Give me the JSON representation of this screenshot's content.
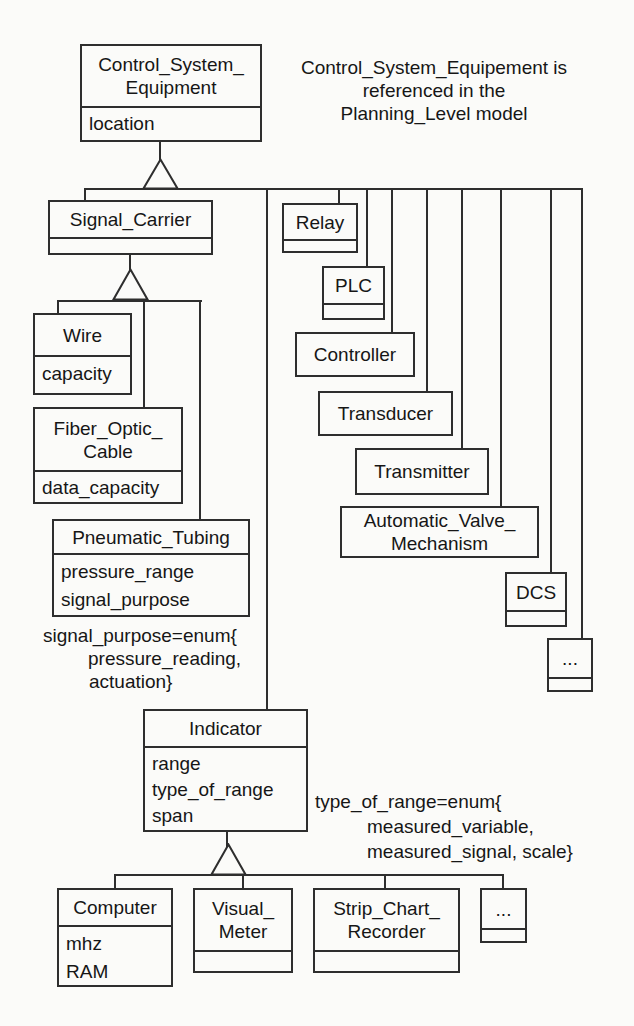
{
  "colors": {
    "background": "#fbfbf9",
    "line": "#2e2e2e",
    "text": "#161616"
  },
  "diagram_type": "class-inheritance-diagram",
  "annotations": {
    "top_note": {
      "lines": [
        "Control_System_Equipement is",
        "referenced in the",
        "Planning_Level model"
      ]
    },
    "signal_purpose_note": {
      "lines": [
        "signal_purpose=enum{",
        "pressure_reading,",
        "actuation}"
      ]
    },
    "type_of_range_note": {
      "lines": [
        "type_of_range=enum{",
        "measured_variable,",
        "measured_signal, scale}"
      ]
    }
  },
  "classes": {
    "cse": {
      "title_lines": [
        "Control_System_",
        "Equipment"
      ],
      "attributes": [
        "location"
      ]
    },
    "signal_carrier": {
      "title_lines": [
        "Signal_Carrier"
      ],
      "attributes": []
    },
    "relay": {
      "title_lines": [
        "Relay"
      ],
      "attributes": []
    },
    "plc": {
      "title_lines": [
        "PLC"
      ],
      "attributes": []
    },
    "controller": {
      "title_lines": [
        "Controller"
      ],
      "attributes": []
    },
    "transducer": {
      "title_lines": [
        "Transducer"
      ],
      "attributes": []
    },
    "transmitter": {
      "title_lines": [
        "Transmitter"
      ],
      "attributes": []
    },
    "avm": {
      "title_lines": [
        "Automatic_Valve_",
        "Mechanism"
      ],
      "attributes": []
    },
    "dcs": {
      "title_lines": [
        "DCS"
      ],
      "attributes": []
    },
    "dots_right": {
      "title_lines": [
        "..."
      ],
      "attributes": []
    },
    "wire": {
      "title_lines": [
        "Wire"
      ],
      "attributes": [
        "capacity"
      ]
    },
    "foc": {
      "title_lines": [
        "Fiber_Optic_",
        "Cable"
      ],
      "attributes": [
        "data_capacity"
      ]
    },
    "pneumatic_tubing": {
      "title_lines": [
        "Pneumatic_Tubing"
      ],
      "attributes": [
        "pressure_range",
        "signal_purpose"
      ]
    },
    "indicator": {
      "title_lines": [
        "Indicator"
      ],
      "attributes": [
        "range",
        "type_of_range",
        "span"
      ]
    },
    "computer": {
      "title_lines": [
        "Computer"
      ],
      "attributes": [
        "mhz",
        "RAM"
      ]
    },
    "visual_meter": {
      "title_lines": [
        "Visual_",
        "Meter"
      ],
      "attributes": []
    },
    "strip_chart_recorder": {
      "title_lines": [
        "Strip_Chart_",
        "Recorder"
      ],
      "attributes": []
    },
    "dots_bottom": {
      "title_lines": [
        "..."
      ],
      "attributes": []
    }
  }
}
